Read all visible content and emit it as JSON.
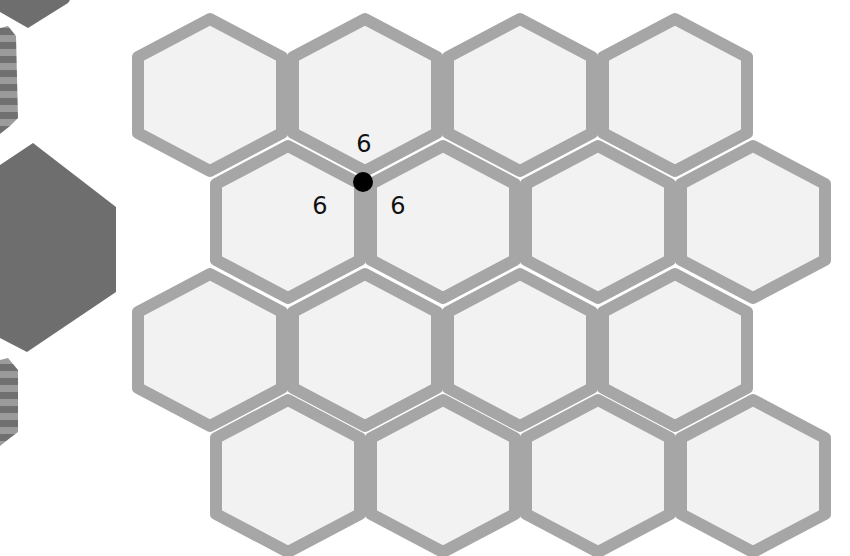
{
  "diagram": {
    "colors": {
      "background": "#ffffff",
      "hex_fill": "#f2f2f2",
      "hex_border": "#a6a6a6",
      "side_dark": "#6e6e6e",
      "stripe_dark": "#707070",
      "stripe_light": "#9b9b9b",
      "vertex_dot": "#000000"
    },
    "grid": {
      "rows": 4,
      "columns": 4,
      "hexagons": [
        {
          "row": 1,
          "cx": 210,
          "cy": 95
        },
        {
          "row": 1,
          "cx": 365,
          "cy": 95
        },
        {
          "row": 1,
          "cx": 520,
          "cy": 95
        },
        {
          "row": 1,
          "cx": 675,
          "cy": 95
        },
        {
          "row": 2,
          "cx": 288,
          "cy": 222
        },
        {
          "row": 2,
          "cx": 443,
          "cy": 222
        },
        {
          "row": 2,
          "cx": 598,
          "cy": 222
        },
        {
          "row": 2,
          "cx": 753,
          "cy": 222
        },
        {
          "row": 3,
          "cx": 210,
          "cy": 350
        },
        {
          "row": 3,
          "cx": 365,
          "cy": 350
        },
        {
          "row": 3,
          "cx": 520,
          "cy": 350
        },
        {
          "row": 3,
          "cx": 675,
          "cy": 350
        },
        {
          "row": 4,
          "cx": 288,
          "cy": 476
        },
        {
          "row": 4,
          "cx": 443,
          "cy": 476
        },
        {
          "row": 4,
          "cx": 598,
          "cy": 476
        },
        {
          "row": 4,
          "cx": 753,
          "cy": 476
        }
      ]
    },
    "vertex": {
      "x": 363,
      "y": 182,
      "labels": [
        {
          "text": "6",
          "x": 364,
          "y": 152,
          "position": "top"
        },
        {
          "text": "6",
          "x": 320,
          "y": 214,
          "position": "left"
        },
        {
          "text": "6",
          "x": 398,
          "y": 214,
          "position": "right"
        }
      ]
    },
    "side_decoration": {
      "shapes": [
        "partial-dark-hexagon-top",
        "striped-hexagon-upper",
        "dark-hexagon-middle",
        "striped-hexagon-lower"
      ]
    }
  }
}
